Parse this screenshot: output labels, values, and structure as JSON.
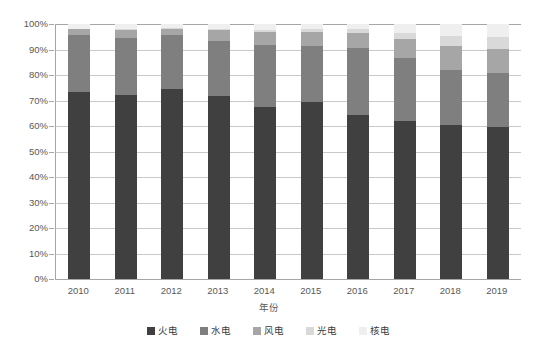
{
  "chart_data": {
    "type": "bar",
    "subtype": "stacked-100-percent",
    "title": "",
    "xlabel": "年份",
    "ylabel": "",
    "categories": [
      "2010",
      "2011",
      "2012",
      "2013",
      "2014",
      "2015",
      "2016",
      "2017",
      "2018",
      "2019"
    ],
    "ylim": [
      0,
      100
    ],
    "y_tick_labels": [
      "0%",
      "10%",
      "20%",
      "30%",
      "40%",
      "50%",
      "60%",
      "70%",
      "80%",
      "90%",
      "100%"
    ],
    "y_tick_values": [
      0,
      10,
      20,
      30,
      40,
      50,
      60,
      70,
      80,
      90,
      100
    ],
    "grid": true,
    "legend_position": "bottom",
    "series": [
      {
        "name": "火电",
        "color": "#404040",
        "values": [
          73.4,
          72.0,
          74.4,
          71.7,
          67.4,
          69.6,
          64.2,
          62.1,
          60.3,
          59.5
        ]
      },
      {
        "name": "水电",
        "color": "#7f7f7f",
        "values": [
          22.2,
          22.6,
          21.1,
          21.8,
          24.3,
          21.6,
          26.3,
          24.4,
          21.7,
          21.1
        ]
      },
      {
        "name": "风电",
        "color": "#a6a6a6",
        "values": [
          2.3,
          3.1,
          2.7,
          4.1,
          5.3,
          5.5,
          6.0,
          7.5,
          9.5,
          9.8
        ]
      },
      {
        "name": "光电",
        "color": "#d9d9d9",
        "values": [
          0.1,
          0.3,
          0.4,
          0.4,
          0.7,
          1.3,
          1.7,
          2.6,
          4.0,
          4.6
        ]
      },
      {
        "name": "核电",
        "color": "#efefef",
        "values": [
          2.0,
          2.0,
          1.4,
          2.0,
          2.3,
          2.0,
          1.8,
          3.4,
          4.5,
          5.0
        ]
      }
    ]
  },
  "axis": {
    "y_suffix": "%"
  },
  "legend": {
    "items": [
      {
        "label": "火电",
        "color": "#404040"
      },
      {
        "label": "水电",
        "color": "#7f7f7f"
      },
      {
        "label": "风电",
        "color": "#a6a6a6"
      },
      {
        "label": "光电",
        "color": "#d9d9d9"
      },
      {
        "label": "核电",
        "color": "#efefef"
      }
    ]
  }
}
